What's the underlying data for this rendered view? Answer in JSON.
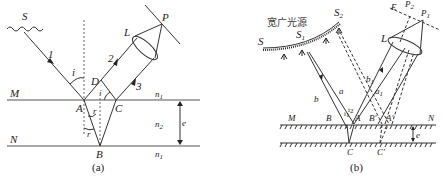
{
  "figure_a": {
    "caption": "(a)",
    "source_label": "S",
    "rays": [
      "1",
      "2",
      "3"
    ],
    "points": {
      "A": "A",
      "B": "B",
      "C": "C",
      "D": "D",
      "L": "L",
      "P": "P"
    },
    "angles": {
      "incidence": "i",
      "incidence2": "i",
      "refraction": "r",
      "refraction2": "r"
    },
    "surfaces": {
      "top": "M",
      "bottom": "N"
    },
    "media": {
      "above": "n",
      "above_sub": "1",
      "film": "n",
      "film_sub": "2",
      "below": "n",
      "below_sub": "1"
    },
    "thickness_label": "e"
  },
  "figure_b": {
    "caption": "(b)",
    "source_title": "宽广光源",
    "source_label": "S",
    "source_points": {
      "s1": "S",
      "s1_sub": "1",
      "s2": "S",
      "s2_sub": "2"
    },
    "rays": {
      "a": "a",
      "b": "b",
      "a1": "a",
      "a1_sub": "1",
      "b1": "b",
      "b1_sub": "1"
    },
    "points": {
      "B": "B",
      "A": "A",
      "Bp": "B'",
      "Ap": "A'",
      "C": "C",
      "Cp": "C'",
      "L": "L",
      "P1": "P",
      "P1_sub": "1",
      "P2": "P",
      "P2_sub": "2",
      "E": "E"
    },
    "angles": {
      "i1": "i",
      "i1_sub": "1",
      "i2": "i",
      "i2_sub": "2"
    },
    "surfaces": {
      "left": "M",
      "right": "N"
    },
    "thickness_label": "e"
  }
}
